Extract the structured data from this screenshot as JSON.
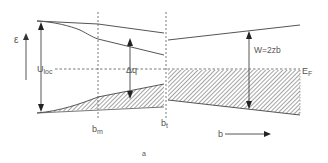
{
  "diagram": {
    "type": "energy-band-diagram",
    "axes": {
      "y_label": "ε",
      "x_label": "b"
    },
    "labels": {
      "u_loc": "U",
      "u_loc_sub": "loc",
      "delta_q": "Δq",
      "w": "W=2zb",
      "e_f": "E",
      "e_f_sub": "F",
      "b_m": "b",
      "b_m_sub": "m",
      "b_t": "b",
      "b_t_sub": "t",
      "caption": "a"
    },
    "colors": {
      "line": "#555555",
      "hatch": "#777777",
      "background": "#ffffff"
    }
  }
}
